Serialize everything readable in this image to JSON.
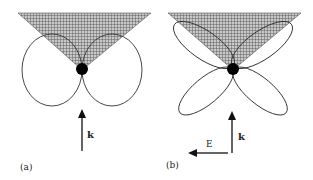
{
  "panels": [
    {
      "id": "a",
      "label": "(a)",
      "pattern": "dipole (two lobes, side by side)",
      "wave_vector_label": "k"
    },
    {
      "id": "b",
      "label": "(b)",
      "pattern": "quadrupole (four lobes, X-shaped)",
      "wave_vector_label": "k",
      "field_label": "E"
    }
  ],
  "colors": {
    "stroke": "#333333",
    "hatch": "#555555",
    "hatch_bg": "#c8c8c8",
    "dot": "#000000"
  }
}
